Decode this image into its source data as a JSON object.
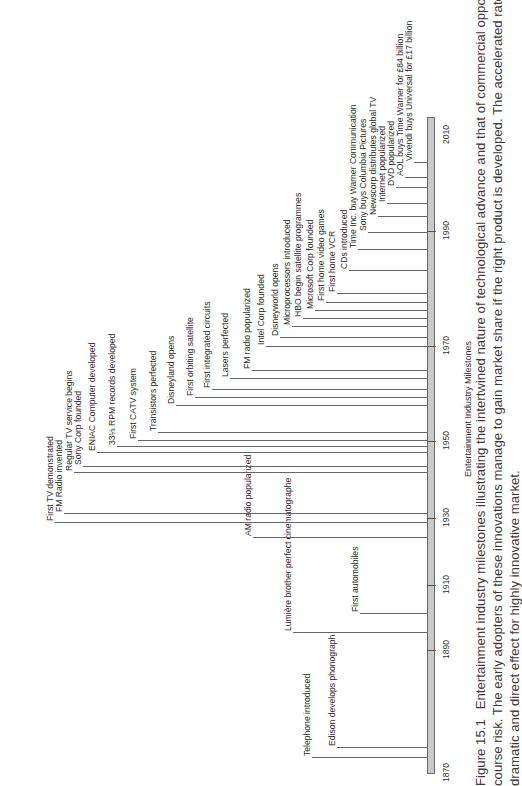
{
  "figure": {
    "axis_title": "Entertainment Industry Milestones",
    "caption_label": "Figure 15.1",
    "caption_lines": [
      "Entertainment industry milestones illustrating the intertwined nature of technological advance and that of commercial opportunity, and of",
      "course risk. The early adopters of these innovations manage to gain market share if the right product is developed. The accelerated rate of change has a",
      "dramatic and direct effect for highly innovative market."
    ]
  },
  "timeline": {
    "years": [
      {
        "label": "1870",
        "y": 773
      },
      {
        "label": "1890",
        "y": 650
      },
      {
        "label": "1910",
        "y": 585
      },
      {
        "label": "1930",
        "y": 518
      },
      {
        "label": "1950",
        "y": 441
      },
      {
        "label": "1970",
        "y": 346
      },
      {
        "label": "1990",
        "y": 231
      },
      {
        "label": "2010",
        "y": 135
      }
    ],
    "events": [
      {
        "label": "Telephone introduced",
        "y": 757,
        "lx": 312
      },
      {
        "label": "Edison develops phonograph",
        "y": 747,
        "lx": 337
      },
      {
        "label": "Lumière brother perfect cinematographe",
        "y": 632,
        "lx": 293
      },
      {
        "label": "First automobiles",
        "y": 613,
        "lx": 360
      },
      {
        "label": "AM radio popularized",
        "y": 537,
        "lx": 253
      },
      {
        "label": "First TV demonstrated",
        "y": 522,
        "lx": 55
      },
      {
        "label": "FM Radio invented",
        "y": 513,
        "lx": 64
      },
      {
        "label": "Regular TV service begins",
        "y": 472,
        "lx": 74
      },
      {
        "label": "Sony Corp founded",
        "y": 466,
        "lx": 83
      },
      {
        "label": "ENIAC Computer developed",
        "y": 452,
        "lx": 97
      },
      {
        "label": "33⅓ RPM records developed",
        "y": 446,
        "lx": 117
      },
      {
        "label": "First CATV system",
        "y": 440,
        "lx": 138
      },
      {
        "label": "Transistors perfected",
        "y": 432,
        "lx": 158
      },
      {
        "label": "Disneyland opens",
        "y": 405,
        "lx": 176
      },
      {
        "label": "First orbiting satellite",
        "y": 397,
        "lx": 195
      },
      {
        "label": "First integrated circuits",
        "y": 389,
        "lx": 212
      },
      {
        "label": "Lasers perfected",
        "y": 378,
        "lx": 230
      },
      {
        "label": "FM radio popularized",
        "y": 370,
        "lx": 252
      },
      {
        "label": "Intel Corp founded",
        "y": 346,
        "lx": 266
      },
      {
        "label": "Disneyworld opens",
        "y": 337,
        "lx": 280
      },
      {
        "label": "Microprocessors introduced",
        "y": 326,
        "lx": 292
      },
      {
        "label": "HBO begin satellite programmes",
        "y": 318,
        "lx": 303
      },
      {
        "label": "Microsoft Corp founded",
        "y": 310,
        "lx": 315
      },
      {
        "label": "First home video games",
        "y": 302,
        "lx": 326
      },
      {
        "label": "First home VCR",
        "y": 293,
        "lx": 337
      },
      {
        "label": "CDs introduced",
        "y": 270,
        "lx": 349
      },
      {
        "label": "Time Inc. buy Warner Communication",
        "y": 249,
        "lx": 358
      },
      {
        "label": "Sony buys Columbia Pictures",
        "y": 232,
        "lx": 368
      },
      {
        "label": "Newscorp distributes global TV",
        "y": 216,
        "lx": 378
      },
      {
        "label": "Internet popularized",
        "y": 203,
        "lx": 387
      },
      {
        "label": "DVD popularized",
        "y": 187,
        "lx": 396
      },
      {
        "label": "AOL buys Time Warner for £84 billion",
        "y": 177,
        "lx": 405
      },
      {
        "label": "Vivendi buys Universal for £17 billion",
        "y": 162,
        "lx": 414
      }
    ]
  },
  "colors": {
    "bar_fill": "#c9c9c9",
    "bar_border": "#6a6a6a",
    "line": "#666666",
    "text": "#2b2b2b"
  }
}
